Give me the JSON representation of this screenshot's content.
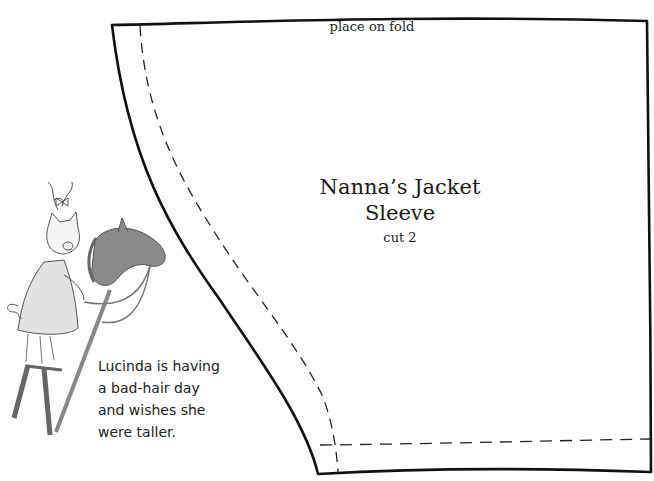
{
  "pattern": {
    "fold_label": "place on fold",
    "title_line1": "Nanna’s Jacket",
    "title_line2": "Sleeve",
    "cut_instruction": "cut 2",
    "outline_color": "#111111",
    "seam_line_style": "dashed"
  },
  "illustration": {
    "subject": "pig-on-stilts-with-hobby-horse",
    "caption_lines": [
      "Lucinda is having",
      "a bad-hair day",
      "and wishes she",
      "were taller."
    ]
  }
}
